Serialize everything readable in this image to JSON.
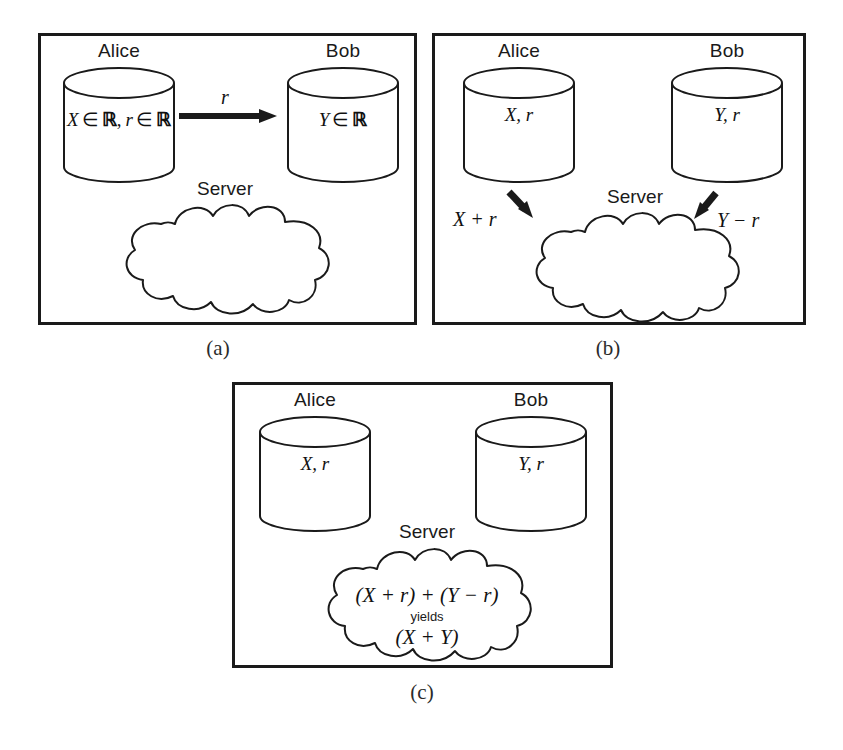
{
  "figure": {
    "panels": [
      {
        "id": "a",
        "caption": "(a)",
        "parties": [
          {
            "name": "Alice",
            "contents": "X ∈ ℝ, r ∈ ℝ",
            "content_parts": {
              "var1": "X",
              "in1": "∈",
              "set1": "ℝ",
              "comma": ",",
              "var2": "r",
              "in2": "∈",
              "set2": "ℝ"
            }
          },
          {
            "name": "Bob",
            "contents": "Y ∈ ℝ",
            "content_parts": {
              "var1": "Y",
              "in1": "∈",
              "set1": "ℝ"
            }
          }
        ],
        "server": {
          "label": "Server",
          "contents": ""
        },
        "arrows": [
          {
            "label": "r",
            "from": "Alice",
            "to": "Bob",
            "direction": "right"
          }
        ]
      },
      {
        "id": "b",
        "caption": "(b)",
        "parties": [
          {
            "name": "Alice",
            "contents": "X, r"
          },
          {
            "name": "Bob",
            "contents": "Y, r"
          }
        ],
        "server": {
          "label": "Server",
          "contents": ""
        },
        "arrows": [
          {
            "label": "X + r",
            "from": "Alice",
            "to": "Server",
            "direction": "down-right"
          },
          {
            "label": "Y − r",
            "from": "Bob",
            "to": "Server",
            "direction": "down-left"
          }
        ]
      },
      {
        "id": "c",
        "caption": "(c)",
        "parties": [
          {
            "name": "Alice",
            "contents": "X, r"
          },
          {
            "name": "Bob",
            "contents": "Y, r"
          }
        ],
        "server": {
          "label": "Server",
          "line1": "(X + r) + (Y − r)",
          "line2": "yields",
          "line3": "(X + Y)"
        },
        "arrows": []
      }
    ]
  },
  "style": {
    "ink": "#111111",
    "panel_border": "#1a1a1a",
    "page_background": "#ffffff"
  }
}
